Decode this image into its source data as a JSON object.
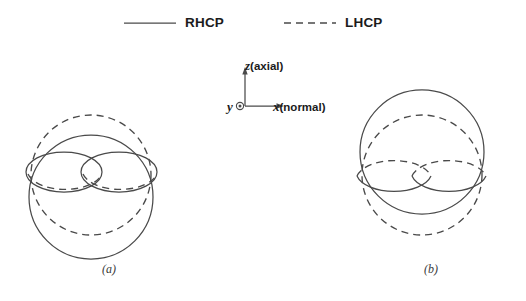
{
  "legend": {
    "items": [
      {
        "label": "RHCP",
        "style": "solid",
        "icon": "solid-line-icon"
      },
      {
        "label": "LHCP",
        "style": "dashed",
        "icon": "dashed-line-icon"
      }
    ]
  },
  "axes": {
    "z": {
      "letter": "z",
      "annotation": "(axial)"
    },
    "x": {
      "letter": "x",
      "annotation": "(normal)"
    },
    "y": {
      "letter": "y",
      "annotation": "",
      "marker": "circled-dot-out-of-page"
    }
  },
  "panels": [
    {
      "caption": "(a)",
      "name": "radiation-pattern-a",
      "major_lobe": {
        "polarization": "RHCP",
        "style": "solid",
        "position": "bottom"
      },
      "mirror_lobe": {
        "polarization": "LHCP",
        "style": "dashed",
        "position": "top"
      },
      "minor_lobes_count": 2
    },
    {
      "caption": "(b)",
      "name": "radiation-pattern-b",
      "major_lobe": {
        "polarization": "RHCP",
        "style": "solid",
        "position": "top"
      },
      "mirror_lobe": {
        "polarization": "LHCP",
        "style": "dashed",
        "position": "bottom"
      },
      "minor_lobes_count": 2
    }
  ],
  "colors": {
    "ink": "#4a4a4a",
    "text": "#1b1b1b",
    "background": "#ffffff"
  }
}
